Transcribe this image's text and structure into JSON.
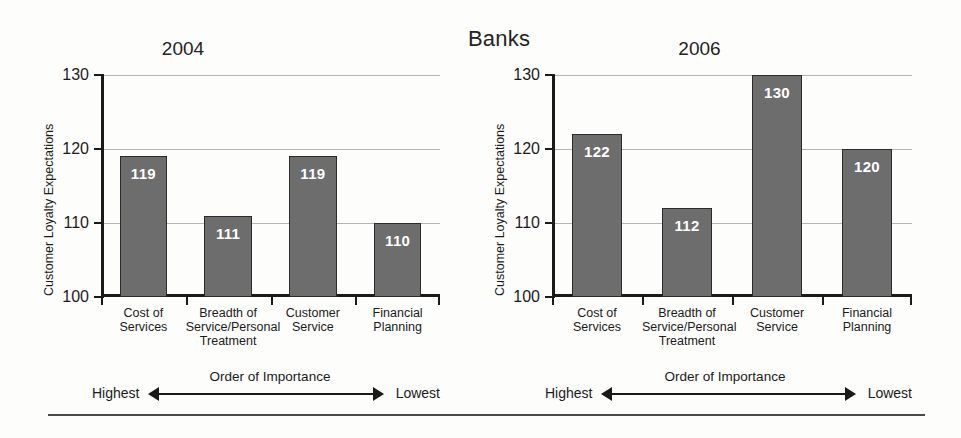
{
  "figure": {
    "super_title": "Banks",
    "bottom_rule": true
  },
  "chart_data": [
    {
      "type": "bar",
      "title": "2004",
      "ylabel": "Customer Loyalty Expectations",
      "xlabel": "Order of Importance",
      "categories": [
        "Cost of Services",
        "Breadth of Service/Personal Treatment",
        "Customer Service",
        "Financial Planning"
      ],
      "category_lines": [
        [
          "Cost of",
          "Services"
        ],
        [
          "Breadth of",
          "Service/Personal",
          "Treatment"
        ],
        [
          "Customer",
          "Service"
        ],
        [
          "Financial",
          "Planning"
        ]
      ],
      "values": [
        119,
        111,
        119,
        110
      ],
      "ylim": [
        100,
        130
      ],
      "yticks": [
        100,
        110,
        120,
        130
      ],
      "grid": true,
      "legend": "none",
      "axis_left_label": "Highest",
      "axis_right_label": "Lowest",
      "bar_color": "#6d6d6d",
      "value_label_color": "#ffffff"
    },
    {
      "type": "bar",
      "title": "2006",
      "ylabel": "Customer Loyalty Expectations",
      "xlabel": "Order of Importance",
      "categories": [
        "Cost of Services",
        "Breadth of Service/Personal Treatment",
        "Customer Service",
        "Financial Planning"
      ],
      "category_lines": [
        [
          "Cost of",
          "Services"
        ],
        [
          "Breadth of",
          "Service/Personal",
          "Treatment"
        ],
        [
          "Customer",
          "Service"
        ],
        [
          "Financial",
          "Planning"
        ]
      ],
      "values": [
        122,
        112,
        130,
        120
      ],
      "ylim": [
        100,
        130
      ],
      "yticks": [
        100,
        110,
        120,
        130
      ],
      "grid": true,
      "legend": "none",
      "axis_left_label": "Highest",
      "axis_right_label": "Lowest",
      "bar_color": "#6d6d6d",
      "value_label_color": "#ffffff"
    }
  ]
}
